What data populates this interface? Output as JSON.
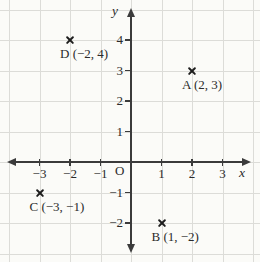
{
  "figure": {
    "background": "#fbfbf8",
    "grid_color": "#dcdcd8",
    "axis_color": "#3b3b3b",
    "text_color": "#2b2b2b",
    "marker_color": "#1d1d1d"
  },
  "chart_data": {
    "type": "scatter",
    "title": "",
    "xlabel": "x",
    "ylabel": "y",
    "origin_label": "O",
    "xlim": [
      -4,
      4
    ],
    "ylim": [
      -5,
      5
    ],
    "grid": true,
    "marker": "cross",
    "x_ticks": [
      {
        "value": -3,
        "label": "−3"
      },
      {
        "value": -2,
        "label": "−2"
      },
      {
        "value": -1,
        "label": "−1"
      },
      {
        "value": 1,
        "label": "1"
      },
      {
        "value": 2,
        "label": "2"
      },
      {
        "value": 3,
        "label": "3"
      }
    ],
    "y_ticks": [
      {
        "value": 4,
        "label": "4"
      },
      {
        "value": 3,
        "label": "3"
      },
      {
        "value": 2,
        "label": "2"
      },
      {
        "value": 1,
        "label": "1"
      },
      {
        "value": -1,
        "label": "−1"
      },
      {
        "value": -2,
        "label": "−2"
      }
    ],
    "points": [
      {
        "name": "D",
        "x": -2,
        "y": 4,
        "label": "D (−2, 4)"
      },
      {
        "name": "A",
        "x": 2,
        "y": 3,
        "label": "A (2, 3)"
      },
      {
        "name": "C",
        "x": -3,
        "y": -1,
        "label": "C (−3, −1)"
      },
      {
        "name": "B",
        "x": 1,
        "y": -2,
        "label": "B (1, −2)"
      }
    ]
  }
}
